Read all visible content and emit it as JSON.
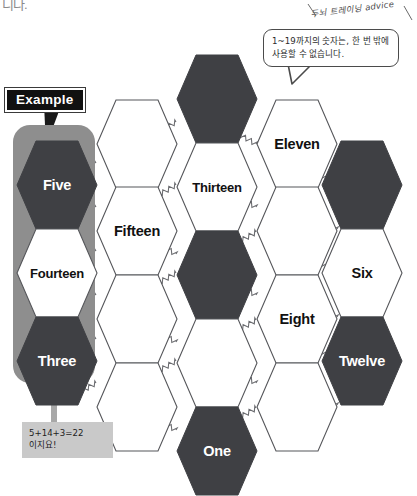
{
  "page": {
    "top_fragment": "니다.",
    "background": "#ffffff"
  },
  "advice": {
    "text": "두뇌 트레이닝 advice"
  },
  "speech_bubble": {
    "text": "1~19까지의 숫자는, 한 번 밖에 사용할 수 없습니다."
  },
  "example": {
    "badge_label": "Example",
    "sum_line1": "5+14+3=22",
    "sum_line2": "이지요!"
  },
  "colors": {
    "dark_hex": "#3f4044",
    "light_hex": "#ffffff",
    "hex_stroke": "#55565a",
    "highlight_panel": "#8e8e8e",
    "badge_bg": "#111111",
    "badge_text": "#ffffff",
    "sum_box_bg": "#c9c9c9"
  },
  "puzzle": {
    "type": "hexagon-number-grid",
    "hexagons": [
      {
        "id": "h-c2-r0",
        "label": "",
        "fill": "dark",
        "x": 176,
        "y": 54
      },
      {
        "id": "h-c1-r0",
        "label": "",
        "fill": "light",
        "x": 96,
        "y": 99
      },
      {
        "id": "h-c3-r0",
        "label": "Eleven",
        "fill": "light",
        "x": 256,
        "y": 99
      },
      {
        "id": "h-c0-r0",
        "label": "Five",
        "fill": "dark",
        "x": 16,
        "y": 140
      },
      {
        "id": "h-c2-r1",
        "label": "Thirteen",
        "fill": "light",
        "x": 176,
        "y": 142
      },
      {
        "id": "h-c4-r0",
        "label": "",
        "fill": "dark",
        "x": 321,
        "y": 140
      },
      {
        "id": "h-c1-r1",
        "label": "Fifteen",
        "fill": "light",
        "x": 96,
        "y": 186
      },
      {
        "id": "h-c3-r1",
        "label": "",
        "fill": "light",
        "x": 256,
        "y": 186
      },
      {
        "id": "h-c0-r1",
        "label": "Fourteen",
        "fill": "light",
        "x": 16,
        "y": 228
      },
      {
        "id": "h-c2-r2",
        "label": "",
        "fill": "dark",
        "x": 176,
        "y": 230
      },
      {
        "id": "h-c4-r1",
        "label": "Six",
        "fill": "light",
        "x": 321,
        "y": 228
      },
      {
        "id": "h-c1-r2",
        "label": "",
        "fill": "light",
        "x": 96,
        "y": 274
      },
      {
        "id": "h-c3-r2",
        "label": "Eight",
        "fill": "light",
        "x": 256,
        "y": 274
      },
      {
        "id": "h-c0-r2",
        "label": "Three",
        "fill": "dark",
        "x": 16,
        "y": 316
      },
      {
        "id": "h-c2-r3",
        "label": "",
        "fill": "light",
        "x": 176,
        "y": 318
      },
      {
        "id": "h-c4-r2",
        "label": "Twelve",
        "fill": "dark",
        "x": 321,
        "y": 316
      },
      {
        "id": "h-c1-r3",
        "label": "",
        "fill": "light",
        "x": 96,
        "y": 362
      },
      {
        "id": "h-c3-r3",
        "label": "",
        "fill": "light",
        "x": 256,
        "y": 362
      },
      {
        "id": "h-c2-r4",
        "label": "One",
        "fill": "dark",
        "x": 176,
        "y": 406
      }
    ],
    "connectors": [
      [
        137,
        144,
        176,
        122
      ],
      [
        218,
        122,
        256,
        144
      ],
      [
        57,
        185,
        96,
        163
      ],
      [
        298,
        163,
        337,
        185
      ],
      [
        57,
        229,
        96,
        207
      ],
      [
        137,
        207,
        176,
        185
      ],
      [
        218,
        185,
        256,
        207
      ],
      [
        298,
        207,
        337,
        229
      ],
      [
        137,
        232,
        176,
        254
      ],
      [
        218,
        254,
        256,
        232
      ],
      [
        57,
        273,
        96,
        251
      ],
      [
        298,
        251,
        337,
        273
      ],
      [
        57,
        317,
        96,
        295
      ],
      [
        137,
        295,
        176,
        273
      ],
      [
        218,
        273,
        256,
        295
      ],
      [
        298,
        295,
        337,
        317
      ],
      [
        137,
        320,
        176,
        342
      ],
      [
        218,
        342,
        256,
        320
      ],
      [
        57,
        361,
        96,
        339
      ],
      [
        298,
        339,
        337,
        361
      ],
      [
        57,
        405,
        96,
        383
      ],
      [
        137,
        383,
        176,
        361
      ],
      [
        218,
        361,
        256,
        383
      ],
      [
        298,
        383,
        337,
        405
      ],
      [
        137,
        408,
        176,
        430
      ],
      [
        218,
        430,
        256,
        408
      ],
      [
        217,
        99,
        217,
        142
      ],
      [
        217,
        187,
        217,
        230
      ],
      [
        217,
        275,
        217,
        318
      ],
      [
        217,
        363,
        217,
        406
      ],
      [
        57,
        185,
        57,
        228
      ],
      [
        57,
        273,
        57,
        316
      ],
      [
        362,
        185,
        362,
        228
      ],
      [
        362,
        273,
        362,
        316
      ]
    ]
  }
}
